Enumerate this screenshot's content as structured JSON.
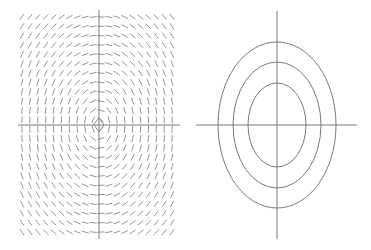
{
  "figure": {
    "panels": [
      {
        "name": "direction-field",
        "description": "Direction field of line segments tangent to nested ellipses around the origin",
        "origin": [
          99,
          125
        ],
        "h_axis": [
          18,
          180
        ],
        "v_axis": [
          10,
          239
        ],
        "grid": {
          "x_start": 22,
          "x_step": 7.9,
          "cols": 20,
          "y_start": 17,
          "y_step": 9.35,
          "rows": 24
        },
        "segment_length": 6.5,
        "ellipse_aspect": [
          58,
          83
        ]
      },
      {
        "name": "level-curves",
        "description": "Three concentric vertically-elongated ellipses centered at origin",
        "origin": [
          277,
          125
        ],
        "h_axis": [
          196,
          357
        ],
        "v_axis": [
          11,
          239
        ],
        "ellipses": [
          {
            "rx": 29,
            "ry": 42
          },
          {
            "rx": 44,
            "ry": 63
          },
          {
            "rx": 59,
            "ry": 83
          }
        ]
      }
    ],
    "colors": {
      "axis": "#7a7a7a",
      "segments": "#8a8a8a",
      "background": "#ffffff"
    }
  }
}
